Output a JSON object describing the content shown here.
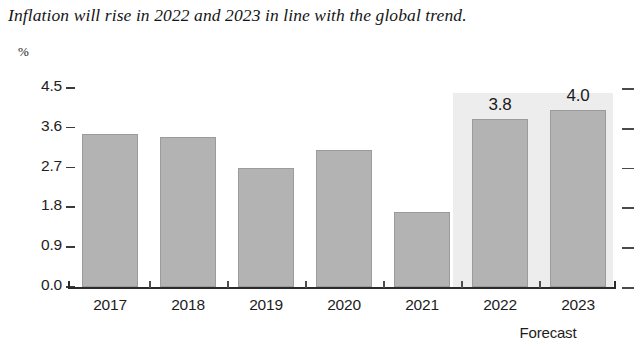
{
  "chart_data": {
    "type": "bar",
    "title": "Inflation will rise in 2022 and 2023 in line with the global trend.",
    "unit_label": "%",
    "xlabel": "",
    "ylabel": "%",
    "categories": [
      "2017",
      "2018",
      "2019",
      "2020",
      "2021",
      "2022",
      "2023"
    ],
    "values": [
      3.45,
      3.4,
      2.7,
      3.1,
      1.7,
      3.8,
      4.0
    ],
    "data_labels": [
      "",
      "",
      "",
      "",
      "",
      "3.8",
      "4.0"
    ],
    "ylim": [
      0.0,
      4.5
    ],
    "yticks": [
      "0.0",
      "0.9",
      "1.8",
      "2.7",
      "3.6",
      "4.5"
    ],
    "ytick_values": [
      0.0,
      0.9,
      1.8,
      2.7,
      3.6,
      4.5
    ],
    "grid": false,
    "legend": null,
    "annotations": [
      {
        "text": "Forecast",
        "covers": [
          "2022",
          "2023"
        ]
      }
    ],
    "series_color": "#b3b3b3",
    "forecast_band_color": "#ededed",
    "axis_color": "#2b2b2b"
  },
  "axis": {
    "forecast_note": "Forecast"
  }
}
